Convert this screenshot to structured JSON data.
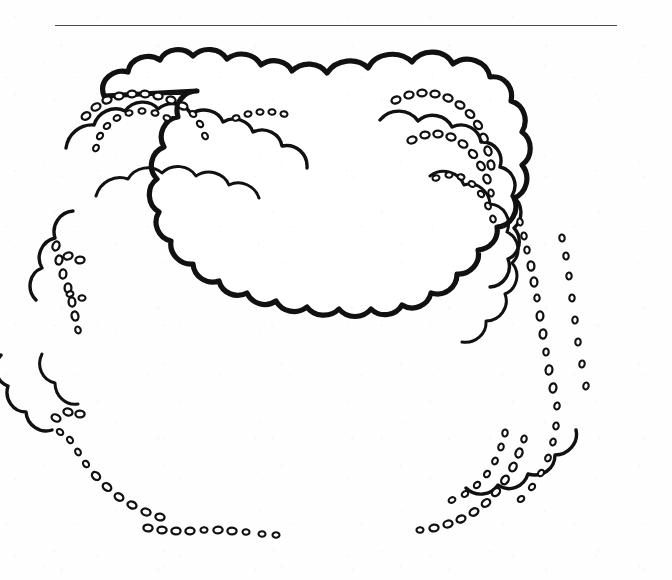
{
  "page": {
    "title": "Decorative cloud border frame",
    "width": 672,
    "height": 580,
    "background_color": "#fefefe",
    "media": "scanned line art",
    "interior_text": ""
  },
  "top_rule": {
    "name": "horizontal-rule",
    "color": "#4a4a4a",
    "x_start": 55,
    "x_end": 617,
    "y": 25,
    "thickness": 1.4
  },
  "border": {
    "name": "cloud-scallop-frame",
    "style": "hand-drawn ink outline",
    "stroke_color": "#111111",
    "fill_color": "#ffffff",
    "layers": 3,
    "texture": "pebble-bead clusters",
    "bounds": {
      "left": 25,
      "top": 42,
      "right": 641,
      "bottom": 556
    },
    "inner_area": {
      "left": 95,
      "top": 150,
      "right": 560,
      "bottom": 470
    }
  },
  "colors": {
    "ink": "#111111",
    "paper": "#fefefe",
    "rule": "#4a4a4a"
  }
}
